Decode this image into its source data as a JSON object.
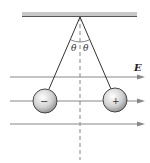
{
  "diagram": {
    "field_label": "E",
    "angle_left": "θ",
    "angle_right": "θ",
    "left_charge_sign": "−",
    "right_charge_sign": "+",
    "colors": {
      "line": "#333333",
      "arrow": "#777777",
      "ceiling": "#aaaaaa"
    }
  }
}
